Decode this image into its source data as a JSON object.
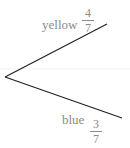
{
  "diagram": {
    "type": "probability-tree",
    "branches": [
      {
        "label": "yellow",
        "probability": {
          "numerator": "4",
          "denominator": "7"
        }
      },
      {
        "label": "blue",
        "probability": {
          "numerator": "3",
          "denominator": "7"
        }
      }
    ]
  }
}
